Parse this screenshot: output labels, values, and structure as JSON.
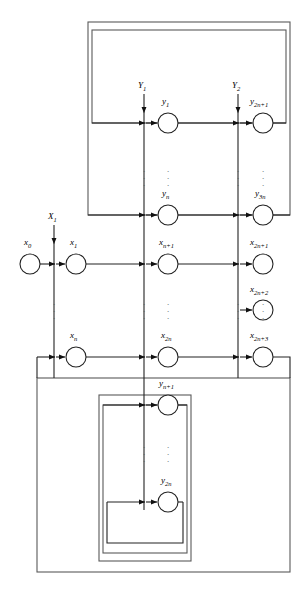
{
  "diagram": {
    "type": "block-flow-graph",
    "colors": {
      "line": "#222222",
      "box": "#555555",
      "node_fill": "#ffffff",
      "background": "#ffffff"
    },
    "inputs": [
      {
        "id": "X1",
        "label_base": "X",
        "label_sub": "1",
        "x": 54,
        "arrow_y": 243
      },
      {
        "id": "Y1",
        "label_base": "Y",
        "label_sub": "1",
        "x": 144,
        "arrow_y": 112
      },
      {
        "id": "Y2",
        "label_base": "Y",
        "label_sub": "2",
        "x": 238,
        "arrow_y": 112
      }
    ],
    "nodes": [
      {
        "id": "x0",
        "base": "x",
        "sub": "0",
        "cx": 30,
        "cy": 264,
        "r": 10
      },
      {
        "id": "x1",
        "base": "x",
        "sub": "1",
        "cx": 76,
        "cy": 264,
        "r": 10
      },
      {
        "id": "xn",
        "base": "x",
        "sub": "n",
        "cx": 76,
        "cy": 357,
        "r": 10
      },
      {
        "id": "y1",
        "base": "y",
        "sub": "1",
        "cx": 168,
        "cy": 123,
        "r": 10
      },
      {
        "id": "yn",
        "base": "y",
        "sub": "n",
        "cx": 168,
        "cy": 215,
        "r": 10
      },
      {
        "id": "xn1",
        "base": "x",
        "sub": "n+1",
        "cx": 168,
        "cy": 264,
        "r": 10
      },
      {
        "id": "x2n",
        "base": "x",
        "sub": "2n",
        "cx": 168,
        "cy": 357,
        "r": 10
      },
      {
        "id": "yn1",
        "base": "y",
        "sub": "n+1",
        "cx": 168,
        "cy": 405,
        "r": 10
      },
      {
        "id": "y2n",
        "base": "y",
        "sub": "2n",
        "cx": 168,
        "cy": 502,
        "r": 10
      },
      {
        "id": "y2n1",
        "base": "y",
        "sub": "2n+1",
        "cx": 263,
        "cy": 123,
        "r": 10
      },
      {
        "id": "y3n",
        "base": "y",
        "sub": "3n",
        "cx": 263,
        "cy": 215,
        "r": 10
      },
      {
        "id": "x2n1",
        "base": "x",
        "sub": "2n+1",
        "cx": 263,
        "cy": 264,
        "r": 10
      },
      {
        "id": "x2n2",
        "base": "x",
        "sub": "2n+2",
        "cx": 263,
        "cy": 310,
        "r": 10
      },
      {
        "id": "x2n3",
        "base": "x",
        "sub": "2n+3",
        "cx": 263,
        "cy": 357,
        "r": 10
      }
    ],
    "ellipsis_columns": [
      {
        "x": 54,
        "y": 312
      },
      {
        "x": 144,
        "y": 179
      },
      {
        "x": 144,
        "y": 312
      },
      {
        "x": 144,
        "y": 455
      },
      {
        "x": 168,
        "y": 179
      },
      {
        "x": 168,
        "y": 312
      },
      {
        "x": 168,
        "y": 455
      },
      {
        "x": 238,
        "y": 179
      },
      {
        "x": 238,
        "y": 312
      },
      {
        "x": 263,
        "y": 179
      },
      {
        "x": 263,
        "y": 312
      }
    ],
    "boxes": [
      {
        "id": "top-outer",
        "x": 88,
        "y": 22,
        "w": 202,
        "h": 193
      },
      {
        "id": "top-inner",
        "x": 92,
        "y": 30,
        "w": 194,
        "h": 93
      },
      {
        "id": "bottom-outer",
        "x": 37,
        "y": 378,
        "w": 253,
        "h": 194
      },
      {
        "id": "bottom-mid",
        "x": 99,
        "y": 395,
        "w": 92,
        "h": 166
      },
      {
        "id": "bottom-inner",
        "x": 103,
        "y": 405,
        "w": 84,
        "h": 148
      }
    ],
    "caption": ""
  }
}
